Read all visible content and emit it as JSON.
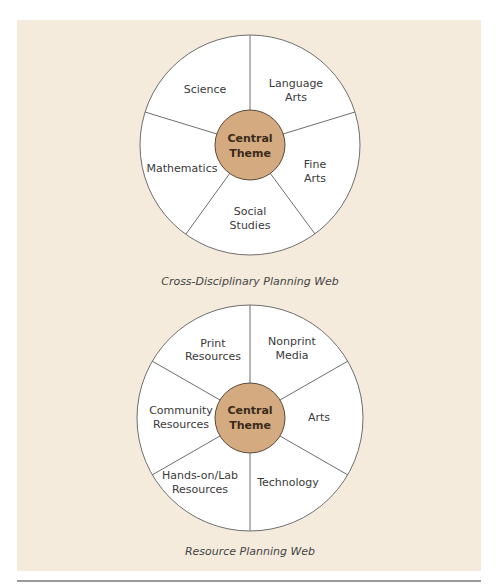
{
  "colors": {
    "panel_bg": "#f4ebdc",
    "hub_fill": "#d4aa80",
    "segment_fill": "#ffffff",
    "stroke": "#6e6e6e"
  },
  "webs": [
    {
      "caption": "Cross-Disciplinary Planning Web",
      "center": {
        "line1": "Central",
        "line2": "Theme"
      },
      "segments": [
        {
          "line1": "Science",
          "line2": ""
        },
        {
          "line1": "Language",
          "line2": "Arts"
        },
        {
          "line1": "Fine",
          "line2": "Arts"
        },
        {
          "line1": "Social",
          "line2": "Studies"
        },
        {
          "line1": "Mathematics",
          "line2": ""
        }
      ]
    },
    {
      "caption": "Resource Planning Web",
      "center": {
        "line1": "Central",
        "line2": "Theme"
      },
      "segments": [
        {
          "line1": "Print",
          "line2": "Resources"
        },
        {
          "line1": "Nonprint",
          "line2": "Media"
        },
        {
          "line1": "Arts",
          "line2": ""
        },
        {
          "line1": "Technology",
          "line2": ""
        },
        {
          "line1": "Hands-on/Lab",
          "line2": "Resources"
        },
        {
          "line1": "Community",
          "line2": "Resources"
        }
      ]
    }
  ]
}
